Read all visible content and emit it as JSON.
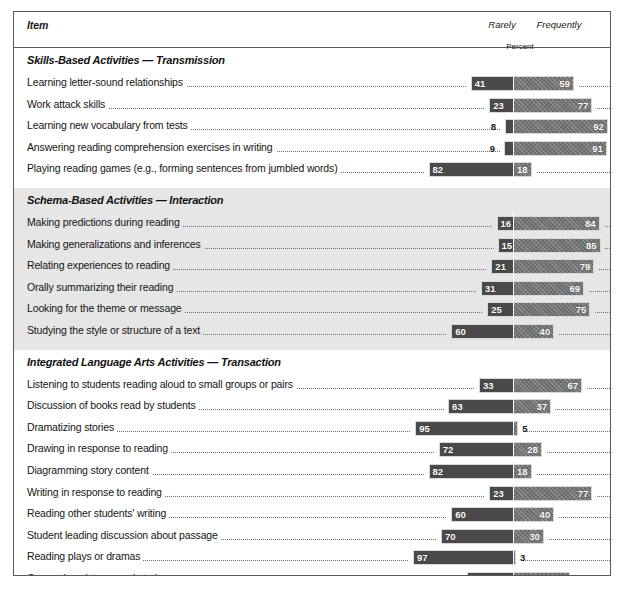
{
  "header": {
    "item_label": "Item",
    "rarely_label": "Rarely",
    "frequently_label": "Frequently",
    "percent_label": "Percent"
  },
  "chart_data": {
    "type": "bar",
    "title": "",
    "subtitle": "",
    "xlabel": "Percent",
    "ylabel": "Item",
    "orientation": "horizontal-diverging",
    "xlim": [
      0,
      100
    ],
    "grid": false,
    "legend_position": "top-right",
    "series": [
      {
        "name": "Rarely",
        "color": "#4a4a4a"
      },
      {
        "name": "Frequently",
        "color": "#737373"
      }
    ],
    "sections": [
      {
        "title": "Skills-Based Activities — Transmission",
        "shaded": false,
        "rows": [
          {
            "label": "Learning letter-sound relationships",
            "rarely": 41,
            "frequently": 59
          },
          {
            "label": "Work attack skills",
            "rarely": 23,
            "frequently": 77
          },
          {
            "label": "Learning new vocabulary from tests",
            "rarely": 8,
            "frequently": 92
          },
          {
            "label": "Answering reading comprehension exercises in writing",
            "rarely": 9,
            "frequently": 91
          },
          {
            "label": "Playing reading games (e.g., forming sentences from jumbled words)",
            "rarely": 82,
            "frequently": 18
          }
        ]
      },
      {
        "title": "Schema-Based Activities — Interaction",
        "shaded": true,
        "rows": [
          {
            "label": "Making predictions during reading",
            "rarely": 16,
            "frequently": 84
          },
          {
            "label": "Making generalizations and inferences",
            "rarely": 15,
            "frequently": 85
          },
          {
            "label": "Relating experiences to reading",
            "rarely": 21,
            "frequently": 79
          },
          {
            "label": "Orally summarizing their reading",
            "rarely": 31,
            "frequently": 69
          },
          {
            "label": "Looking for the theme or message",
            "rarely": 25,
            "frequently": 75
          },
          {
            "label": "Studying the style or structure of a text",
            "rarely": 60,
            "frequently": 40
          }
        ]
      },
      {
        "title": "Integrated Language Arts Activities — Transaction",
        "shaded": false,
        "rows": [
          {
            "label": "Listening to students reading aloud to small groups or pairs",
            "rarely": 33,
            "frequently": 67
          },
          {
            "label": "Discussion of books read by students",
            "rarely": 63,
            "frequently": 37
          },
          {
            "label": "Dramatizing stories",
            "rarely": 95,
            "frequently": 5
          },
          {
            "label": "Drawing in response to reading",
            "rarely": 72,
            "frequently": 28
          },
          {
            "label": "Diagramming story content",
            "rarely": 82,
            "frequently": 18
          },
          {
            "label": "Writing in response to reading",
            "rarely": 23,
            "frequently": 77
          },
          {
            "label": "Reading other students' writing",
            "rarely": 60,
            "frequently": 40
          },
          {
            "label": "Student leading discussion about passage",
            "rarely": 70,
            "frequently": 30
          },
          {
            "label": "Reading plays or dramas",
            "rarely": 97,
            "frequently": 3
          },
          {
            "label": "Comparing pictures and stories",
            "rarely": 45,
            "frequently": 55
          }
        ]
      }
    ]
  }
}
